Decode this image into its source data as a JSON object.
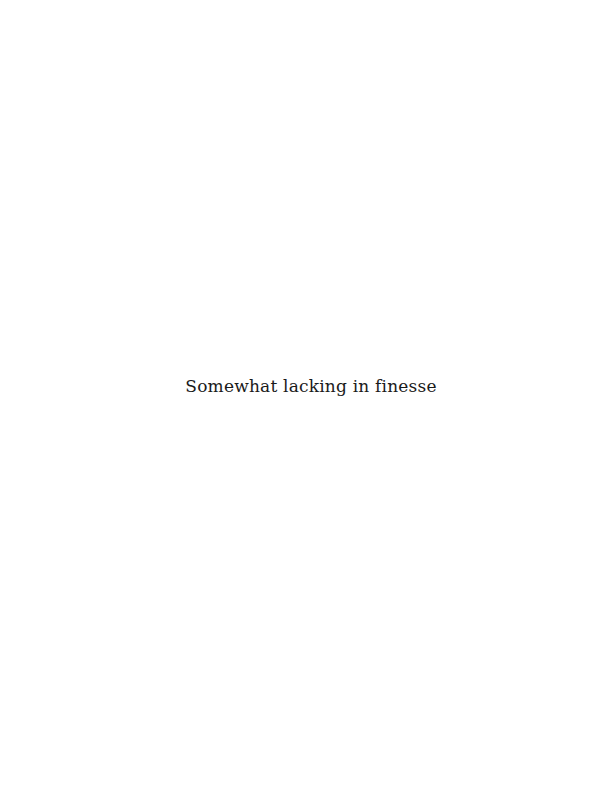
{
  "page": {
    "caption": "Somewhat lacking in finesse",
    "background_color": "#ffffff",
    "text_color": "#1a1a1a"
  }
}
